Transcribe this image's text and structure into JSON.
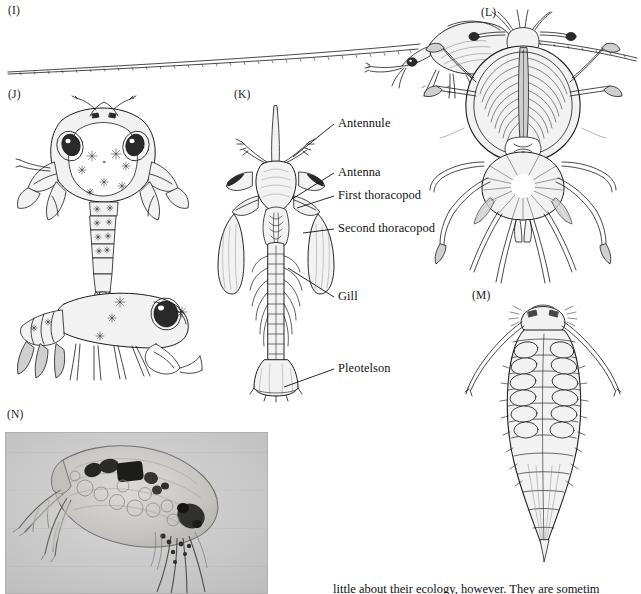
{
  "figure": {
    "type": "scientific-plate",
    "background_color": "#ffffff",
    "ink_color": "#1b1b1b"
  },
  "panels": [
    {
      "id": "I",
      "letter": "(I)",
      "letter_x": 8,
      "letter_y": 4,
      "kind": "line-drawing",
      "description": "Elongate crustacean in lateral view with extremely long horizontal antennae spanning the page width",
      "bbox": [
        0,
        12,
        640,
        80
      ]
    },
    {
      "id": "J",
      "letter": "(J)",
      "letter_x": 8,
      "letter_y": 88,
      "kind": "line-drawing",
      "description": "Crab-like crustacean: upper dorsal view with broad carapace, large dark eyes, chelipeds and segmented abdomen; lower lateral view of same animal",
      "bbox": [
        5,
        100,
        210,
        290
      ]
    },
    {
      "id": "K",
      "letter": "(K)",
      "letter_x": 234,
      "letter_y": 88,
      "kind": "line-drawing",
      "description": "Ventral view of a shrimp-like crustacean with labelled appendages",
      "bbox": [
        205,
        100,
        135,
        300
      ]
    },
    {
      "id": "L",
      "letter": "(L)",
      "letter_x": 481,
      "letter_y": 6,
      "kind": "line-drawing",
      "description": "Long-legged sea-spider-like crustacean, dorsal view, with stalked eyes and radiating setose legs",
      "bbox": [
        435,
        16,
        205,
        265
      ]
    },
    {
      "id": "M",
      "letter": "(M)",
      "letter_x": 472,
      "letter_y": 289,
      "kind": "line-drawing",
      "description": "Isopod-like crustacean in dorsal view, tapering segmented body with paired lateral appendages",
      "bbox": [
        470,
        300,
        150,
        260
      ]
    },
    {
      "id": "N",
      "letter": "(N)",
      "letter_x": 7,
      "letter_y": 408,
      "kind": "photograph",
      "description": "Light micrograph of a water flea (cladoceran) showing transparent carapace, compound eye and branched antennae",
      "photo_bbox": [
        5,
        432,
        263,
        162
      ],
      "photo_background": "#c9c9c9"
    }
  ],
  "callouts": [
    {
      "label": "Antennule",
      "text_x": 338,
      "text_y": 124,
      "leader_to_x": 293,
      "leader_to_y": 157
    },
    {
      "label": "Antenna",
      "text_x": 338,
      "text_y": 173,
      "leader_to_x": 292,
      "leader_to_y": 199
    },
    {
      "label": "First thoracopod",
      "text_x": 338,
      "text_y": 196,
      "leader_to_x": 297,
      "leader_to_y": 208
    },
    {
      "label": "Second thoracopod",
      "text_x": 338,
      "text_y": 229,
      "leader_to_x": 303,
      "leader_to_y": 233
    },
    {
      "label": "Gill",
      "text_x": 338,
      "text_y": 297,
      "leader_to_x": 288,
      "leader_to_y": 268
    },
    {
      "label": "Pleotelson",
      "text_x": 338,
      "text_y": 369,
      "leader_to_x": 284,
      "leader_to_y": 387
    }
  ],
  "body_text": {
    "clipped_line": "little about their ecology, however. They are sometim",
    "x": 333,
    "y": 582
  }
}
